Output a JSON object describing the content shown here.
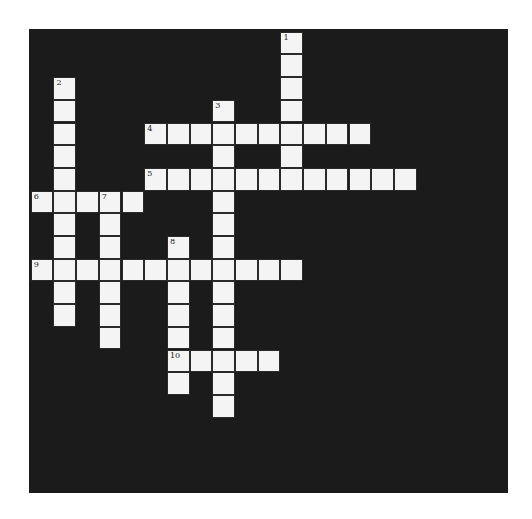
{
  "puzzle": {
    "cell_size": 22.7,
    "origin": {
      "x": 1.7,
      "y": 2.7
    },
    "colors": {
      "board": "#1b1b1b",
      "cell": "#f4f4f4",
      "cell_border": "#2a2a2a",
      "number": "#222222"
    },
    "words": [
      {
        "number": "1",
        "direction": "down",
        "row": 0,
        "col": 11,
        "length": 7
      },
      {
        "number": "2",
        "direction": "down",
        "row": 2,
        "col": 1,
        "length": 11
      },
      {
        "number": "3",
        "direction": "down",
        "row": 3,
        "col": 8,
        "length": 14
      },
      {
        "number": "4",
        "direction": "across",
        "row": 4,
        "col": 5,
        "length": 10
      },
      {
        "number": "5",
        "direction": "across",
        "row": 6,
        "col": 5,
        "length": 12
      },
      {
        "number": "6",
        "direction": "across",
        "row": 7,
        "col": 0,
        "length": 5
      },
      {
        "number": "7",
        "direction": "down",
        "row": 7,
        "col": 3,
        "length": 7
      },
      {
        "number": "8",
        "direction": "down",
        "row": 9,
        "col": 6,
        "length": 7
      },
      {
        "number": "9",
        "direction": "across",
        "row": 10,
        "col": 0,
        "length": 12
      },
      {
        "number": "10",
        "direction": "across",
        "row": 14,
        "col": 6,
        "length": 5
      }
    ]
  }
}
